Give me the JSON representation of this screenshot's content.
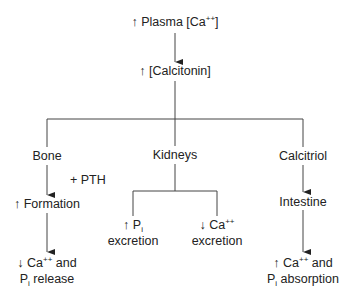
{
  "diagram": {
    "top": {
      "arrow": "↑",
      "text": "Plasma [Ca",
      "sup": "++",
      "close": "]"
    },
    "calcitonin": {
      "arrow": "↑",
      "text": "[Calcitonin]"
    },
    "branches": {
      "bone": {
        "label": "Bone",
        "modifier": "+ PTH",
        "step": {
          "arrow": "↑",
          "text": "Formation"
        },
        "result": {
          "arrow": "↓",
          "line1": "Ca",
          "sup": "++",
          "line1_end": " and",
          "line2": "P",
          "sub": "i",
          "line2_end": " release"
        }
      },
      "kidneys": {
        "label": "Kidneys",
        "left": {
          "arrow": "↑",
          "text": "P",
          "sub": "i",
          "line2": "excretion"
        },
        "right": {
          "arrow": "↓",
          "text": "Ca",
          "sup": "++",
          "line2": "excretion"
        }
      },
      "calcitriol": {
        "label": "Calcitriol",
        "step": {
          "text": "Intestine"
        },
        "result": {
          "arrow": "↑",
          "line1": "Ca",
          "sup": "++",
          "line1_end": " and",
          "line2": "P",
          "sub": "i",
          "line2_end": " absorption"
        }
      }
    },
    "colors": {
      "line": "#333333",
      "text": "#222222"
    }
  }
}
